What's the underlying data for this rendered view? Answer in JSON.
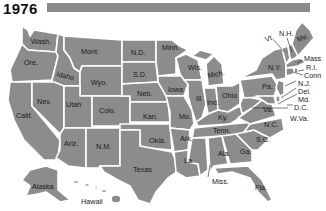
{
  "header": {
    "year": "1976"
  },
  "colors": {
    "state_fill": "#8c8c8c",
    "border": "#ffffff",
    "bar": "#8a8a8a",
    "text": "#1a1a1a"
  },
  "states": {
    "wash": "Wash.",
    "ore": "Ore.",
    "calif": "Calif.",
    "idaho": "Idaho",
    "nev": "Nev.",
    "mont": "Mont.",
    "wyo": "Wyo.",
    "utah": "Utah",
    "colo": "Colo.",
    "ariz": "Ariz.",
    "nm": "N.M.",
    "nd": "N.D.",
    "sd": "S.D.",
    "neb": "Neb.",
    "kan": "Kan.",
    "okla": "Okla.",
    "texas": "Texas",
    "minn": "Minn.",
    "iowa": "Iowa",
    "mo": "Mo.",
    "ark": "Ark.",
    "la": "La.",
    "wis": "Wis.",
    "ill": "Ill.",
    "mich": "Mich.",
    "ind": "Ind.",
    "ohio": "Ohio",
    "ky": "Ky.",
    "tenn": "Tenn.",
    "miss": "Miss.",
    "ala": "Ala.",
    "ga": "Ga.",
    "fla": "Fla.",
    "sc": "S.C.",
    "nc": "N.C.",
    "va": "Va.",
    "wva": "W.Va.",
    "pa": "Pa.",
    "ny": "N.Y.",
    "vt": "Vt.",
    "nh": "N.H.",
    "me": "Me.",
    "mass": "Mass",
    "ri": "R.I.",
    "conn": "Conn",
    "nj": "N.J.",
    "del": "Del.",
    "md": "Md.",
    "dc": "D.C.",
    "alaska": "Alaska",
    "hawaii": "Hawaii"
  }
}
